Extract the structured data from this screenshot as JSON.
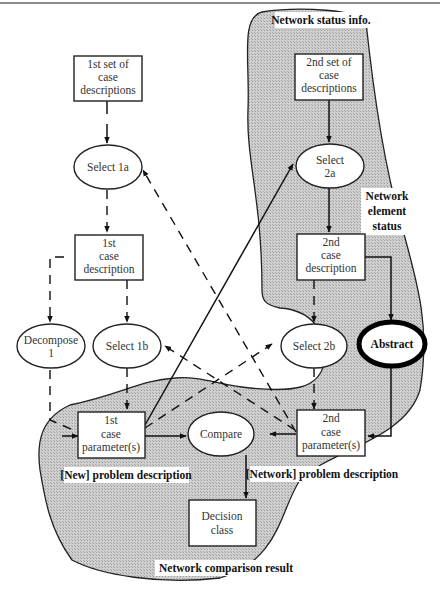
{
  "diagram": {
    "nodes": {
      "set1": [
        "1st set of",
        "case",
        "descriptions"
      ],
      "select1a": [
        "Select 1a"
      ],
      "case1": [
        "1st",
        "case",
        "description"
      ],
      "decompose1": [
        "Decompose",
        "1"
      ],
      "select1b": [
        "Select 1b"
      ],
      "param1": [
        "1st",
        "case",
        "parameter(s)"
      ],
      "compare": [
        "Compare"
      ],
      "decision": [
        "Decision",
        "class"
      ],
      "set2": [
        "2nd set of",
        "case",
        "descriptions"
      ],
      "select2a": [
        "Select",
        "2a"
      ],
      "case2": [
        "2nd",
        "case",
        "description"
      ],
      "select2b": [
        "Select 2b"
      ],
      "abstract": [
        "Abstract"
      ],
      "param2": [
        "2nd",
        "case",
        "parameter(s)"
      ]
    },
    "region_labels": {
      "network_status": "Network status info.",
      "network_element_status": [
        "Network",
        "element",
        "status"
      ],
      "new_problem": "[New] problem description",
      "network_problem": "[Network] problem description",
      "comparison_result": "Network comparison result"
    },
    "colors": {
      "region_fill": "#c4c4c4",
      "line": "#111111",
      "background": "#ffffff"
    }
  }
}
